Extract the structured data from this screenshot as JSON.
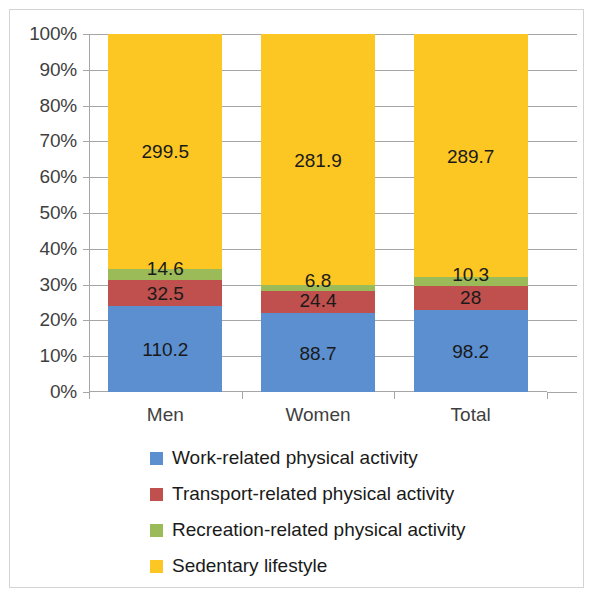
{
  "chart_data": {
    "type": "bar",
    "subtype": "stacked-100-percent",
    "title": "",
    "xlabel": "",
    "ylabel": "",
    "ylim": [
      0,
      100
    ],
    "ytick_labels": [
      "0%",
      "10%",
      "20%",
      "30%",
      "40%",
      "50%",
      "60%",
      "70%",
      "80%",
      "90%",
      "100%"
    ],
    "ytick_values": [
      0,
      10,
      20,
      30,
      40,
      50,
      60,
      70,
      80,
      90,
      100
    ],
    "grid": true,
    "legend_position": "bottom",
    "categories": [
      "Men",
      "Women",
      "Total"
    ],
    "series": [
      {
        "name": "Work-related physical activity",
        "color": "#5b8fd0",
        "values": [
          110.2,
          88.7,
          98.2
        ],
        "labels": [
          "110.2",
          "88.7",
          "98.2"
        ]
      },
      {
        "name": "Transport-related physical activity",
        "color": "#c0504d",
        "values": [
          32.5,
          24.4,
          28
        ],
        "labels": [
          "32.5",
          "24.4",
          "28"
        ]
      },
      {
        "name": "Recreation-related physical activity",
        "color": "#9bbb59",
        "values": [
          14.6,
          6.8,
          10.3
        ],
        "labels": [
          "14.6",
          "6.8",
          "10.3"
        ]
      },
      {
        "name": "Sedentary lifestyle",
        "color": "#fcc723",
        "values": [
          299.5,
          281.9,
          289.7
        ],
        "labels": [
          "299.5",
          "281.9",
          "289.7"
        ]
      }
    ]
  },
  "axis": {
    "y_labels": [
      {
        "text": "100%",
        "value": 100
      },
      {
        "text": "90%",
        "value": 90
      },
      {
        "text": "80%",
        "value": 80
      },
      {
        "text": "70%",
        "value": 70
      },
      {
        "text": "60%",
        "value": 60
      },
      {
        "text": "50%",
        "value": 50
      },
      {
        "text": "40%",
        "value": 40
      },
      {
        "text": "30%",
        "value": 30
      },
      {
        "text": "20%",
        "value": 20
      },
      {
        "text": "10%",
        "value": 10
      },
      {
        "text": "0%",
        "value": 0
      }
    ],
    "x_labels": [
      "Men",
      "Women",
      "Total"
    ]
  },
  "legend": {
    "items": [
      {
        "label": "Work-related physical activity",
        "color": "#5b8fd0"
      },
      {
        "label": "Transport-related physical activity",
        "color": "#c0504d"
      },
      {
        "label": "Recreation-related physical activity",
        "color": "#9bbb59"
      },
      {
        "label": "Sedentary lifestyle",
        "color": "#fcc723"
      }
    ]
  },
  "colors": {
    "work": "#5b8fd0",
    "transport": "#c0504d",
    "recreation": "#9bbb59",
    "sedentary": "#fcc723",
    "grid": "#a6a6a6",
    "text": "#3f3f3f",
    "frame": "#d4d4d4"
  }
}
